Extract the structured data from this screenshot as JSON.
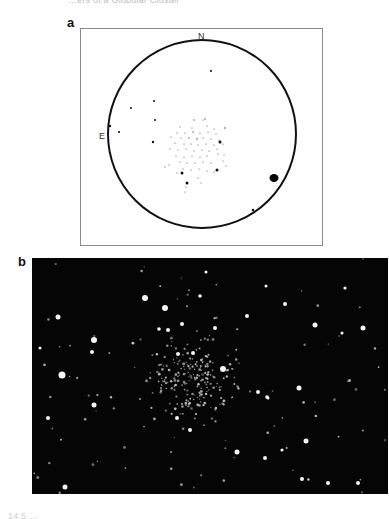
{
  "captions": {
    "top": "…ers of a Globular Cluster",
    "bottom": "14.5 …"
  },
  "panels": {
    "a": {
      "label": "a",
      "type": "finder-chart-drawing",
      "compass": {
        "north": "N",
        "east": "E"
      },
      "circle": {
        "cx": 121,
        "cy": 105,
        "r": 94
      },
      "stars": [
        [
          130,
          42,
          1.0
        ],
        [
          50,
          79,
          1.0
        ],
        [
          73,
          72,
          1.0
        ],
        [
          74,
          91,
          1.0
        ],
        [
          29,
          97,
          1.2
        ],
        [
          38,
          103,
          1.1
        ],
        [
          72,
          113,
          1.2
        ],
        [
          113,
          91,
          0.7
        ],
        [
          122,
          91,
          0.6
        ],
        [
          126,
          97,
          0.6
        ],
        [
          99,
          98,
          0.6
        ],
        [
          111,
          99,
          0.6
        ],
        [
          133,
          100,
          0.6
        ],
        [
          96,
          104,
          0.6
        ],
        [
          104,
          104,
          0.6
        ],
        [
          112,
          103,
          0.7
        ],
        [
          119,
          104,
          0.6
        ],
        [
          127,
          103,
          0.6
        ],
        [
          135,
          105,
          0.6
        ],
        [
          90,
          108,
          0.6
        ],
        [
          100,
          109,
          0.6
        ],
        [
          108,
          109,
          0.7
        ],
        [
          116,
          110,
          0.8
        ],
        [
          122,
          109,
          0.6
        ],
        [
          130,
          110,
          0.6
        ],
        [
          138,
          111,
          0.6
        ],
        [
          94,
          114,
          0.6
        ],
        [
          103,
          115,
          0.6
        ],
        [
          110,
          115,
          0.6
        ],
        [
          117,
          116,
          0.6
        ],
        [
          125,
          115,
          0.6
        ],
        [
          133,
          116,
          0.6
        ],
        [
          142,
          115,
          0.6
        ],
        [
          89,
          120,
          0.6
        ],
        [
          97,
          121,
          0.6
        ],
        [
          105,
          120,
          0.6
        ],
        [
          113,
          122,
          0.6
        ],
        [
          121,
          121,
          0.6
        ],
        [
          128,
          122,
          0.6
        ],
        [
          136,
          120,
          0.6
        ],
        [
          95,
          127,
          0.6
        ],
        [
          103,
          128,
          0.6
        ],
        [
          111,
          127,
          0.6
        ],
        [
          119,
          128,
          0.6
        ],
        [
          126,
          127,
          0.6
        ],
        [
          137,
          125,
          0.6
        ],
        [
          143,
          126,
          0.6
        ],
        [
          99,
          133,
          0.6
        ],
        [
          106,
          134,
          0.6
        ],
        [
          114,
          134,
          0.6
        ],
        [
          122,
          133,
          0.6
        ],
        [
          130,
          134,
          0.6
        ],
        [
          142,
          132,
          0.6
        ],
        [
          145,
          137,
          0.6
        ],
        [
          84,
          138,
          0.6
        ],
        [
          88,
          136,
          0.6
        ],
        [
          102,
          140,
          0.6
        ],
        [
          110,
          141,
          0.6
        ],
        [
          118,
          140,
          0.6
        ],
        [
          126,
          142,
          0.6
        ],
        [
          96,
          144,
          0.6
        ],
        [
          133,
          143,
          0.6
        ],
        [
          117,
          149,
          0.6
        ],
        [
          120,
          154,
          0.6
        ],
        [
          105,
          158,
          0.6
        ],
        [
          104,
          163,
          0.6
        ],
        [
          139,
          113,
          1.5
        ],
        [
          101,
          144,
          1.5
        ],
        [
          136,
          141,
          1.5
        ],
        [
          106,
          154,
          1.5
        ],
        [
          144,
          99,
          0.8
        ],
        [
          124,
          90,
          0.7
        ]
      ],
      "bright_star": {
        "cx": 193,
        "cy": 149,
        "rx": 4.5,
        "ry": 4
      },
      "lower_star": [
        172,
        181,
        1.3
      ]
    },
    "b": {
      "label": "b",
      "type": "photograph",
      "description": "Negative-contrast photograph of a globular star cluster: white stars on black sky"
    }
  }
}
